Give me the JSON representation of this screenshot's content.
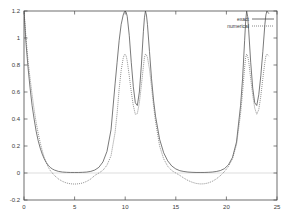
{
  "chart_data": {
    "type": "line",
    "title": "",
    "xlabel": "",
    "ylabel": "",
    "xlim": [
      0,
      25
    ],
    "ylim": [
      -0.2,
      1.2
    ],
    "grid": false,
    "legend_position": "top-right",
    "xticks": [
      "0",
      "5",
      "10",
      "15",
      "20",
      "25"
    ],
    "xtick_values": [
      0,
      5,
      10,
      15,
      20,
      25
    ],
    "yticks": [
      "-0.2",
      "0",
      "0.2",
      "0.4",
      "0.6",
      "0.8",
      "1",
      "1.2"
    ],
    "ytick_values": [
      -0.2,
      0,
      0.2,
      0.4,
      0.6,
      0.8,
      1,
      1.2
    ],
    "series": [
      {
        "name": "exact",
        "style": "solid",
        "color": "#4d4d4d",
        "x": [
          0.0,
          0.2,
          0.4,
          0.6,
          0.8,
          1.0,
          1.2,
          1.4,
          1.6,
          1.8,
          2.0,
          2.2,
          2.4,
          2.6,
          2.8,
          3.0,
          3.4,
          3.8,
          4.2,
          4.6,
          5.0,
          5.4,
          5.8,
          6.2,
          6.6,
          7.0,
          7.4,
          7.8,
          8.2,
          8.6,
          9.0,
          9.2,
          9.4,
          9.6,
          9.8,
          9.9,
          10.0,
          10.1,
          10.2,
          10.4,
          10.6,
          10.8,
          11.0,
          11.2,
          11.4,
          11.6,
          11.8,
          11.9,
          12.0,
          12.1,
          12.2,
          12.4,
          12.6,
          12.8,
          13.0,
          13.4,
          13.8,
          14.2,
          14.6,
          15.0,
          15.4,
          15.8,
          16.2,
          16.6,
          17.0,
          17.4,
          17.8,
          18.2,
          18.6,
          19.0,
          19.4,
          19.8,
          20.2,
          20.6,
          21.0,
          21.4,
          21.6,
          21.8,
          21.9,
          22.0,
          22.1,
          22.2,
          22.4,
          22.6,
          22.8,
          23.0,
          23.2,
          23.4,
          23.6,
          23.8,
          23.9,
          24.0,
          24.1,
          24.2
        ],
        "y": [
          1.2,
          0.96,
          0.78,
          0.63,
          0.5,
          0.4,
          0.31,
          0.24,
          0.185,
          0.14,
          0.105,
          0.078,
          0.057,
          0.041,
          0.03,
          0.022,
          0.012,
          0.007,
          0.005,
          0.004,
          0.004,
          0.004,
          0.005,
          0.007,
          0.012,
          0.022,
          0.042,
          0.082,
          0.16,
          0.32,
          0.66,
          0.82,
          0.98,
          1.1,
          1.17,
          1.19,
          1.2,
          1.19,
          1.16,
          1.02,
          0.82,
          0.64,
          0.52,
          0.5,
          0.6,
          0.8,
          1.05,
          1.15,
          1.2,
          1.17,
          1.1,
          0.9,
          0.7,
          0.54,
          0.42,
          0.25,
          0.15,
          0.09,
          0.052,
          0.03,
          0.017,
          0.011,
          0.007,
          0.005,
          0.004,
          0.004,
          0.004,
          0.005,
          0.007,
          0.011,
          0.018,
          0.032,
          0.06,
          0.115,
          0.23,
          0.5,
          0.7,
          0.98,
          1.12,
          1.2,
          1.16,
          1.06,
          0.82,
          0.63,
          0.52,
          0.5,
          0.58,
          0.72,
          0.9,
          1.1,
          1.17,
          1.2,
          1.19,
          1.18
        ]
      },
      {
        "name": "numerical",
        "style": "dotted",
        "color": "#6b6b6b",
        "x": [
          0.0,
          0.2,
          0.4,
          0.6,
          0.8,
          1.0,
          1.2,
          1.4,
          1.6,
          1.8,
          2.0,
          2.2,
          2.4,
          2.6,
          2.8,
          3.0,
          3.4,
          3.8,
          4.2,
          4.6,
          5.0,
          5.4,
          5.8,
          6.2,
          6.6,
          7.0,
          7.4,
          7.8,
          8.2,
          8.6,
          9.0,
          9.2,
          9.4,
          9.6,
          9.8,
          9.9,
          10.0,
          10.1,
          10.2,
          10.4,
          10.6,
          10.8,
          11.0,
          11.2,
          11.4,
          11.6,
          11.8,
          11.9,
          12.0,
          12.1,
          12.2,
          12.4,
          12.6,
          12.8,
          13.0,
          13.4,
          13.8,
          14.2,
          14.6,
          15.0,
          15.4,
          15.8,
          16.2,
          16.6,
          17.0,
          17.4,
          17.8,
          18.2,
          18.6,
          19.0,
          19.4,
          19.8,
          20.2,
          20.6,
          21.0,
          21.4,
          21.6,
          21.8,
          21.9,
          22.0,
          22.1,
          22.2,
          22.4,
          22.6,
          22.8,
          23.0,
          23.2,
          23.4,
          23.6,
          23.8,
          23.9,
          24.0,
          24.1,
          24.2
        ],
        "y": [
          1.2,
          1.0,
          0.83,
          0.7,
          0.58,
          0.47,
          0.375,
          0.295,
          0.225,
          0.165,
          0.115,
          0.075,
          0.043,
          0.018,
          0.0,
          -0.018,
          -0.044,
          -0.062,
          -0.074,
          -0.08,
          -0.082,
          -0.08,
          -0.074,
          -0.062,
          -0.044,
          -0.018,
          0.0,
          0.02,
          0.058,
          0.128,
          0.3,
          0.44,
          0.62,
          0.76,
          0.85,
          0.875,
          0.88,
          0.865,
          0.83,
          0.72,
          0.6,
          0.5,
          0.435,
          0.44,
          0.52,
          0.65,
          0.79,
          0.855,
          0.88,
          0.875,
          0.855,
          0.77,
          0.64,
          0.5,
          0.38,
          0.2,
          0.105,
          0.05,
          0.018,
          0.0,
          -0.018,
          -0.038,
          -0.055,
          -0.068,
          -0.077,
          -0.081,
          -0.08,
          -0.074,
          -0.062,
          -0.044,
          -0.02,
          0.01,
          0.048,
          0.105,
          0.21,
          0.44,
          0.6,
          0.78,
          0.855,
          0.88,
          0.865,
          0.83,
          0.7,
          0.58,
          0.48,
          0.435,
          0.47,
          0.57,
          0.7,
          0.82,
          0.865,
          0.88,
          0.875,
          0.865
        ]
      }
    ],
    "legend": [
      {
        "label": "exact",
        "style": "solid"
      },
      {
        "label": "numerical",
        "style": "dotted"
      }
    ]
  }
}
